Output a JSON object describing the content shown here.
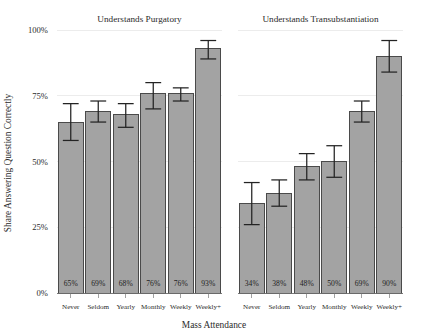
{
  "chart_data": {
    "type": "bar",
    "title": "",
    "xlabel": "Mass Attendance",
    "ylabel": "Share Answering Question Correctly",
    "ylim": [
      0,
      100
    ],
    "ytick_labels": [
      "0%",
      "25%",
      "50%",
      "75%",
      "100%"
    ],
    "ytick_values": [
      0,
      25,
      50,
      75,
      100
    ],
    "grid": true,
    "legend": "none",
    "categories": [
      "Never",
      "Seldom",
      "Yearly",
      "Monthly",
      "Weekly",
      "Weekly+"
    ],
    "panels": [
      {
        "title": "Understands Purgatory",
        "values": [
          65,
          69,
          68,
          76,
          76,
          93
        ],
        "value_labels": [
          "65%",
          "69%",
          "68%",
          "76%",
          "76%",
          "93%"
        ],
        "ci_low": [
          58,
          65,
          63,
          70,
          73,
          89
        ],
        "ci_high": [
          72,
          73,
          72,
          80,
          78,
          96
        ]
      },
      {
        "title": "Understands Transubstantiation",
        "values": [
          34,
          38,
          48,
          50,
          69,
          90
        ],
        "value_labels": [
          "34%",
          "38%",
          "48%",
          "50%",
          "69%",
          "90%"
        ],
        "ci_low": [
          26,
          33,
          43,
          44,
          65,
          84
        ],
        "ci_high": [
          42,
          43,
          53,
          56,
          73,
          96
        ]
      }
    ],
    "colors": {
      "bar_fill": "#a3a3a3",
      "bar_stroke": "#4a4a4a",
      "error_bar": "#232323",
      "gridline": "#e4e4e4",
      "axis": "#6d6d6d",
      "text": "#2b2b2b",
      "background": "#ffffff"
    }
  }
}
